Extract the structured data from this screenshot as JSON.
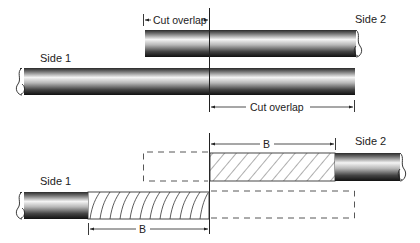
{
  "top_panel": {
    "side1_label": "Side 1",
    "side2_label": "Side 2",
    "cut_overlap_top_label": "Cut overlap",
    "cut_overlap_bottom_label": "Cut overlap"
  },
  "bottom_panel": {
    "side1_label": "Side 1",
    "side2_label": "Side 2",
    "dimension_top_label": "B",
    "dimension_bottom_label": "B"
  },
  "colors": {
    "pipe_dark": "#1a1a1a",
    "pipe_light": "#f2f2f2",
    "line": "#222222",
    "background": "#ffffff"
  }
}
